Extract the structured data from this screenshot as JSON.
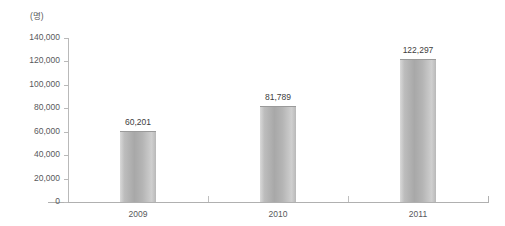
{
  "chart_data": {
    "type": "bar",
    "title": "",
    "subtitle": "",
    "xlabel": "",
    "ylabel": "",
    "unit_label": "(명)",
    "categories": [
      "2009",
      "2010",
      "2011"
    ],
    "values": [
      60201,
      81789,
      122297
    ],
    "value_labels": [
      "60,201",
      "81,789",
      "122,297"
    ],
    "ylim": [
      0,
      140000
    ],
    "ytick_values": [
      0,
      20000,
      40000,
      60000,
      80000,
      100000,
      120000,
      140000
    ],
    "ytick_labels": [
      "0",
      "20,000",
      "40,000",
      "60,000",
      "80,000",
      "100,000",
      "120,000",
      "140,000"
    ],
    "grid": false,
    "legend": false,
    "legend_position": "none",
    "bar_color": "#b4b4b4",
    "axis_color": "#b9b9b9",
    "text_color": "#58595b"
  }
}
